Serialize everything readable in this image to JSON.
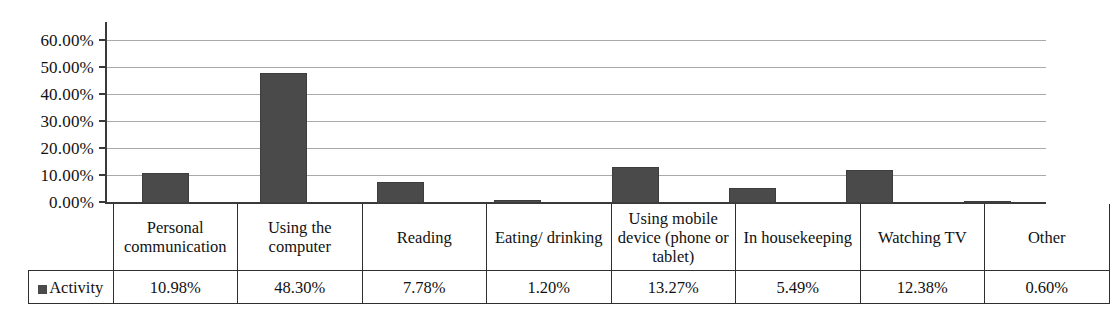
{
  "chart_data": {
    "type": "bar",
    "title": "",
    "xlabel": "",
    "ylabel": "",
    "ylim": [
      0,
      60
    ],
    "grid": true,
    "legend_position": "table-row-header",
    "series_name": "Activity",
    "categories": [
      "Personal communication",
      "Using the computer",
      "Reading",
      "Eating/ drinking",
      "Using mobile device (phone or tablet)",
      "In housekeeping",
      "Watching TV",
      "Other"
    ],
    "values": [
      10.98,
      48.3,
      7.78,
      1.2,
      13.27,
      5.49,
      12.38,
      0.6
    ],
    "value_labels": [
      "10.98%",
      "48.30%",
      "7.78%",
      "1.20%",
      "13.27%",
      "5.49%",
      "12.38%",
      "0.60%"
    ],
    "y_ticks": [
      0,
      10,
      20,
      30,
      40,
      50,
      60
    ],
    "y_tick_labels": [
      "0.00%",
      "10.00%",
      "20.00%",
      "30.00%",
      "40.00%",
      "50.00%",
      "60.00%"
    ],
    "bar_color": "#4a4a4a",
    "gridline_color": "#9a9a9a",
    "axis_color": "#3a3a3a"
  },
  "table": {
    "legend_label": "Activity",
    "legend_swatch_color": "#4a4a4a",
    "category_cells": [
      "Personal communication",
      "Using the computer",
      "Reading",
      "Eating/ drinking",
      "Using mobile device (phone or tablet)",
      "In housekeeping",
      "Watching TV",
      "Other"
    ],
    "value_cells": [
      "10.98%",
      "48.30%",
      "7.78%",
      "1.20%",
      "13.27%",
      "5.49%",
      "12.38%",
      "0.60%"
    ]
  }
}
